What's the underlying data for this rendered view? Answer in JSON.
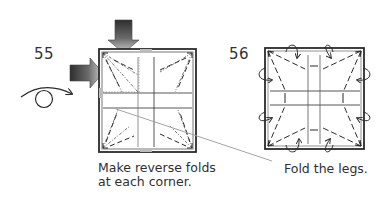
{
  "steps": [
    {
      "number": "55",
      "caption_lines": [
        "Make reverse folds",
        "at each corner."
      ],
      "symbols": [
        "push-arrow-down",
        "push-arrow-right",
        "turn-over-symbol",
        "mountain-fold-lines",
        "valley-fold-lines"
      ]
    },
    {
      "number": "56",
      "caption_lines": [
        "Fold the legs."
      ],
      "symbols": [
        "fold-arrows",
        "valley-fold-lines"
      ]
    }
  ],
  "colors": {
    "line": "#2b2b2b",
    "arrow_dark": "#3a3a3a",
    "arrow_light": "#bdbdbd",
    "leader": "#9a9a9a"
  }
}
